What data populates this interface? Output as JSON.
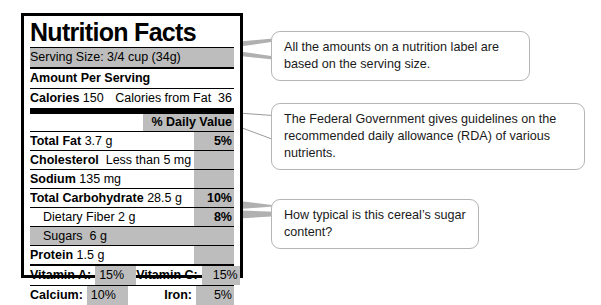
{
  "label": {
    "title": "Nutrition Facts",
    "serving_size": "Serving Size: 3/4 cup (34g)",
    "amount_per_serving": "Amount Per Serving",
    "calories_label": "Calories",
    "calories_value": "150",
    "calories_from_fat_label": "Calories from Fat",
    "calories_from_fat_value": "36",
    "daily_value_header": "% Daily Value",
    "rows": [
      {
        "name": "Total Fat",
        "amount": "3.7 g",
        "dv": "5%"
      },
      {
        "name": "Cholesterol",
        "amount": "Less than 5 mg",
        "dv": ""
      },
      {
        "name": "Sodium",
        "amount": "135 mg",
        "dv": ""
      },
      {
        "name": "Total Carbohydrate",
        "amount": "28.5 g",
        "dv": "10%"
      },
      {
        "name": "Dietary Fiber",
        "amount": "2 g",
        "dv": "8%"
      },
      {
        "name": "Sugars",
        "amount": "6 g",
        "dv": ""
      },
      {
        "name": "Protein",
        "amount": "1.5 g",
        "dv": ""
      }
    ],
    "micronutrients": [
      {
        "left_label": "Vitamin A:",
        "left_value": "15%",
        "right_label": "Vitamin C:",
        "right_value": "15%"
      },
      {
        "left_label": "Calcium:",
        "left_value": "10%",
        "right_label": "Iron:",
        "right_value": "5%"
      }
    ]
  },
  "callouts": {
    "serving": "All the amounts on a nutrition label are based on the serving size.",
    "rda": "The Federal Government gives guidelines on the recommended daily allowance (RDA) of various nutrients.",
    "sugar": "How typical is this cereal’s sugar content?"
  },
  "colors": {
    "shade": "#bdbdbd",
    "border": "#000000",
    "callout_border": "#b5b5b5",
    "leader_fill": "#b0b0b0"
  }
}
